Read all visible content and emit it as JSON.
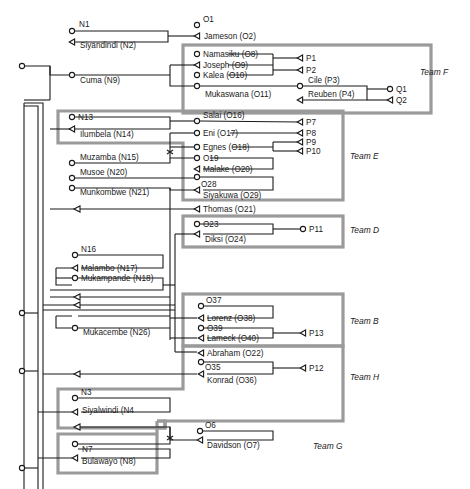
{
  "diagram": {
    "type": "network",
    "teams": [
      {
        "id": "F",
        "label": "Team F",
        "box": [
          183,
          44,
          248,
          69
        ],
        "label_pos": [
          420,
          75
        ]
      },
      {
        "id": "E",
        "label": "Team E",
        "box": [
          58,
          110,
          175,
          48
        ],
        "label_pos": [
          350,
          159
        ],
        "box2": [
          183,
          143,
          160,
          57
        ]
      },
      {
        "id": "D",
        "label": "Team D",
        "box": [
          183,
          216,
          160,
          31
        ],
        "label_pos": [
          350,
          233
        ]
      },
      {
        "id": "B",
        "label": "Team B",
        "box": [
          183,
          294,
          160,
          51
        ],
        "label_pos": [
          350,
          324
        ]
      },
      {
        "id": "H",
        "label": "Team H",
        "box": [
          58,
          345,
          285,
          83
        ],
        "label_pos": [
          350,
          380
        ]
      },
      {
        "id": "G",
        "label": "Team G",
        "box": [
          58,
          434,
          99,
          24
        ],
        "label_pos": [
          313,
          449
        ],
        "box2": [
          157,
          420,
          0,
          0
        ]
      }
    ],
    "nodes": [
      {
        "id": "N1",
        "label": "N1",
        "x": 72,
        "y": 31,
        "kind": "circle",
        "label_dx": 7,
        "label_dy": -4
      },
      {
        "id": "N2",
        "label": "Siyandindi (N2)",
        "x": 72,
        "y": 42,
        "kind": "tri",
        "label_dx": 8,
        "label_dy": 6
      },
      {
        "id": "O1",
        "label": "O1",
        "x": 197,
        "y": 25,
        "kind": "circle",
        "label_dx": 6,
        "label_dy": -3
      },
      {
        "id": "O2",
        "label": "Jameson (O2)",
        "x": 197,
        "y": 36,
        "kind": "tri",
        "label_dx": 7,
        "label_dy": 3
      },
      {
        "id": "N9",
        "label": "Cuma (N9)",
        "x": 72,
        "y": 75,
        "kind": "circle",
        "label_dx": 8,
        "label_dy": 8
      },
      {
        "id": "O8",
        "label": "Namasiku (O8)",
        "x": 197,
        "y": 54,
        "kind": "circle",
        "label_dx": 6,
        "label_dy": 3
      },
      {
        "id": "O9",
        "label": "Joseph (O9)",
        "x": 197,
        "y": 65,
        "kind": "tri",
        "label_dx": 6,
        "label_dy": 3
      },
      {
        "id": "O10",
        "label": "Kalea (O10)",
        "x": 197,
        "y": 75,
        "kind": "circle",
        "label_dx": 6,
        "label_dy": 3
      },
      {
        "id": "O11",
        "label": "Mukaswana (O11)",
        "x": 197,
        "y": 86,
        "kind": "circle",
        "label_dx": 8,
        "label_dy": 11
      },
      {
        "id": "P1",
        "label": "P1",
        "x": 300,
        "y": 58,
        "kind": "tri",
        "label_dx": 6,
        "label_dy": 3
      },
      {
        "id": "P2",
        "label": "P2",
        "x": 300,
        "y": 70,
        "kind": "tri",
        "label_dx": 6,
        "label_dy": 3
      },
      {
        "id": "P3",
        "label": "Cile (P3)",
        "x": 300,
        "y": 86,
        "kind": "circle",
        "label_dx": 8,
        "label_dy": -3
      },
      {
        "id": "P4",
        "label": "Reuben (P4)",
        "x": 300,
        "y": 100,
        "kind": "tri",
        "label_dx": 8,
        "label_dy": -3
      },
      {
        "id": "Q1",
        "label": "Q1",
        "x": 390,
        "y": 89,
        "kind": "circle",
        "label_dx": 6,
        "label_dy": 3
      },
      {
        "id": "Q2",
        "label": "Q2",
        "x": 390,
        "y": 100,
        "kind": "tri",
        "label_dx": 6,
        "label_dy": 3
      },
      {
        "id": "N13",
        "label": "N13",
        "x": 72,
        "y": 117,
        "kind": "circle",
        "label_dx": 6,
        "label_dy": 3
      },
      {
        "id": "N14",
        "label": "Ilumbela (N14)",
        "x": 72,
        "y": 129,
        "kind": "tri",
        "label_dx": 8,
        "label_dy": 8
      },
      {
        "id": "O16",
        "label": "Salai (O16)",
        "x": 197,
        "y": 121,
        "kind": "circle",
        "label_dx": 6,
        "label_dy": -3
      },
      {
        "id": "O17",
        "label": "Eni (O17)",
        "x": 197,
        "y": 133,
        "kind": "circle",
        "label_dx": 6,
        "label_dy": 3
      },
      {
        "id": "P7",
        "label": "P7",
        "x": 300,
        "y": 122,
        "kind": "tri",
        "label_dx": 6,
        "label_dy": 3
      },
      {
        "id": "P8",
        "label": "P8",
        "x": 300,
        "y": 133,
        "kind": "tri",
        "label_dx": 6,
        "label_dy": 3
      },
      {
        "id": "O18",
        "label": "Egnes (O18)",
        "x": 197,
        "y": 147,
        "kind": "circle",
        "label_dx": 6,
        "label_dy": 3
      },
      {
        "id": "P9",
        "label": "P9",
        "x": 300,
        "y": 142,
        "kind": "tri",
        "label_dx": 6,
        "label_dy": 3
      },
      {
        "id": "P10",
        "label": "P10",
        "x": 300,
        "y": 151,
        "kind": "tri",
        "label_dx": 6,
        "label_dy": 3
      },
      {
        "id": "N15",
        "label": "Muzamba (N15)",
        "x": 72,
        "y": 163,
        "kind": "circle",
        "label_dx": 8,
        "label_dy": -3
      },
      {
        "id": "O19",
        "label": "O19",
        "x": 197,
        "y": 158,
        "kind": "circle",
        "label_dx": 6,
        "label_dy": 3
      },
      {
        "id": "O20",
        "label": "Malake (O20)",
        "x": 197,
        "y": 169,
        "kind": "tri",
        "label_dx": 6,
        "label_dy": 3
      },
      {
        "id": "N20",
        "label": "Musoe (N20)",
        "x": 72,
        "y": 178,
        "kind": "circle",
        "label_dx": 8,
        "label_dy": -3
      },
      {
        "id": "O28",
        "label": "O28",
        "x": 197,
        "y": 177,
        "kind": "circle",
        "label_dx": 4,
        "label_dy": 10
      },
      {
        "id": "N21",
        "label": "Munkombwe (N21)",
        "x": 72,
        "y": 188,
        "kind": "circle",
        "label_dx": 8,
        "label_dy": 7
      },
      {
        "id": "O29",
        "label": "Siyakuwa (O29)",
        "x": 197,
        "y": 190,
        "kind": "tri",
        "label_dx": 6,
        "label_dy": 8
      },
      {
        "id": "O21",
        "label": "Thomas (O21)",
        "x": 197,
        "y": 209,
        "kind": "tri",
        "label_dx": 6,
        "label_dy": 3
      },
      {
        "id": "O23",
        "label": "O23",
        "x": 197,
        "y": 224,
        "kind": "circle",
        "label_dx": 6,
        "label_dy": 3
      },
      {
        "id": "O24",
        "label": "Diksi (O24)",
        "x": 197,
        "y": 234,
        "kind": "tri",
        "label_dx": 8,
        "label_dy": 8
      },
      {
        "id": "P11",
        "label": "P11",
        "x": 303,
        "y": 229,
        "kind": "circle",
        "label_dx": 6,
        "label_dy": 3
      },
      {
        "id": "N16",
        "label": "N16",
        "x": 75,
        "y": 255,
        "kind": "circle",
        "label_dx": 6,
        "label_dy": -3
      },
      {
        "id": "N17",
        "label": "Malambo (N17)",
        "x": 75,
        "y": 268,
        "kind": "tri",
        "label_dx": 6,
        "label_dy": 3
      },
      {
        "id": "N18",
        "label": "Mukampande (N18)",
        "x": 75,
        "y": 278,
        "kind": "circle",
        "label_dx": 6,
        "label_dy": 3
      },
      {
        "id": "O37",
        "label": "O37",
        "x": 201,
        "y": 306,
        "kind": "circle",
        "label_dx": 5,
        "label_dy": -3
      },
      {
        "id": "O38",
        "label": "Lorenz (O38)",
        "x": 201,
        "y": 318,
        "kind": "tri",
        "label_dx": 6,
        "label_dy": 3
      },
      {
        "id": "N26",
        "label": "Mukacembe (N26)",
        "x": 75,
        "y": 328,
        "kind": "circle",
        "label_dx": 8,
        "label_dy": 7
      },
      {
        "id": "O39",
        "label": "O39",
        "x": 201,
        "y": 328,
        "kind": "circle",
        "label_dx": 6,
        "label_dy": 3
      },
      {
        "id": "O40",
        "label": "Lameck (O40)",
        "x": 201,
        "y": 338,
        "kind": "tri",
        "label_dx": 6,
        "label_dy": 3
      },
      {
        "id": "P13",
        "label": "P13",
        "x": 303,
        "y": 333,
        "kind": "tri",
        "label_dx": 6,
        "label_dy": 3
      },
      {
        "id": "O22",
        "label": "Abraham (O22)",
        "x": 201,
        "y": 353,
        "kind": "tri",
        "label_dx": 6,
        "label_dy": 3
      },
      {
        "id": "O35",
        "label": "O35",
        "x": 201,
        "y": 362,
        "kind": "circle",
        "label_dx": 4,
        "label_dy": 8
      },
      {
        "id": "O36",
        "label": "Konrad (O36)",
        "x": 201,
        "y": 374,
        "kind": "tri",
        "label_dx": 6,
        "label_dy": 9
      },
      {
        "id": "P12",
        "label": "P12",
        "x": 303,
        "y": 368,
        "kind": "tri",
        "label_dx": 6,
        "label_dy": 3
      },
      {
        "id": "N3",
        "label": "N3",
        "x": 75,
        "y": 398,
        "kind": "circle",
        "label_dx": 6,
        "label_dy": -3
      },
      {
        "id": "N4",
        "label": "Siyalwindi (N4",
        "x": 75,
        "y": 412,
        "kind": "tri",
        "label_dx": 7,
        "label_dy": 1
      },
      {
        "id": "O6",
        "label": "O6",
        "x": 200,
        "y": 431,
        "kind": "circle",
        "label_dx": 5,
        "label_dy": -3
      },
      {
        "id": "O7",
        "label": "Davidson (O7)",
        "x": 200,
        "y": 440,
        "kind": "tri",
        "label_dx": 7,
        "label_dy": 8
      },
      {
        "id": "N7",
        "label": "N7",
        "x": 75,
        "y": 444,
        "kind": "circle",
        "label_dx": 7,
        "label_dy": 8
      },
      {
        "id": "N8",
        "label": "Bulawayo (N8)",
        "x": 75,
        "y": 458,
        "kind": "tri",
        "label_dx": 7,
        "label_dy": 6
      }
    ],
    "left_terminals": [
      {
        "id": "L1",
        "x": 22,
        "y": 66
      },
      {
        "id": "L2",
        "x": 22,
        "y": 313
      },
      {
        "id": "L3",
        "x": 22,
        "y": 371
      },
      {
        "id": "L4",
        "x": 22,
        "y": 468
      }
    ]
  }
}
